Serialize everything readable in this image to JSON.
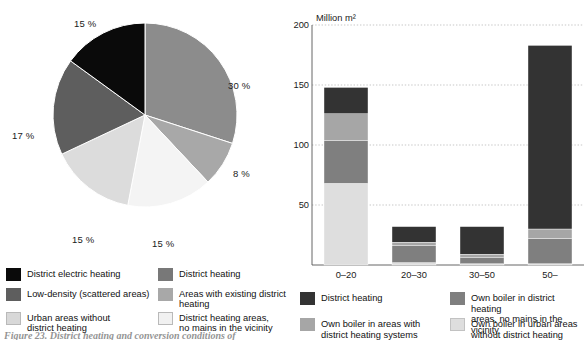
{
  "figure": {
    "caption": "Figure 23.  District heating and conversion conditions of"
  },
  "pie": {
    "labels": [
      "30 %",
      "8 %",
      "15 %",
      "15 %",
      "17 %",
      "15 %"
    ],
    "legend": [
      {
        "label": "District electric heating",
        "color": "#0a0a0a"
      },
      {
        "label": "District heating",
        "color": "#787878"
      },
      {
        "label": "Low-density (scattered areas)",
        "color": "#5e5e5e"
      },
      {
        "label": "Areas with existing district\nheating",
        "color": "#a8a8a8"
      },
      {
        "label": "Urban areas without\ndistrict heating",
        "color": "#d8d8d8"
      },
      {
        "label": "District heating areas,\nno mains in the vicinity",
        "color": "#f1f1f1"
      }
    ]
  },
  "bar": {
    "axis_unit": "Million m²",
    "y_ticks": [
      "200",
      "150",
      "100",
      "50"
    ],
    "x_ticks": [
      "0–20",
      "20–30",
      "30–50",
      "50–"
    ],
    "legend": [
      {
        "label": "District heating",
        "color": "#333333"
      },
      {
        "label": "Own boiler in district heating\nareas, no mains in the vicinity",
        "color": "#7f7f7f"
      },
      {
        "label": "Own boiler in areas with\ndistrict heating systems",
        "color": "#a6a6a6"
      },
      {
        "label": "Own boiler in urban areas\nwithout district heating",
        "color": "#dedede"
      }
    ]
  },
  "chart_data": [
    {
      "type": "pie",
      "title": "",
      "categories": [
        "District heating",
        "Areas with existing district heating",
        "District heating areas, no mains in the vicinity",
        "Urban areas without district heating",
        "Low-density (scattered areas)",
        "District electric heating"
      ],
      "values": [
        30,
        8,
        15,
        15,
        17,
        15
      ],
      "data_labels": [
        "30 %",
        "8 %",
        "15 %",
        "15 %",
        "17 %",
        "15 %"
      ],
      "colors": [
        "#8c8c8c",
        "#a8a8a8",
        "#f4f4f4",
        "#dcdcdc",
        "#5e5e5e",
        "#0a0a0a"
      ],
      "legend": "below",
      "units": "percent"
    },
    {
      "type": "bar",
      "stacked": true,
      "title": "",
      "xlabel": "",
      "ylabel": "Million m²",
      "ylim": [
        0,
        200
      ],
      "yticks": [
        0,
        50,
        100,
        150,
        200
      ],
      "grid": true,
      "categories": [
        "0–20",
        "20–30",
        "30–50",
        "50–"
      ],
      "series": [
        {
          "name": "Own boiler in urban areas without district heating",
          "color": "#dedede",
          "values": [
            68,
            2,
            1,
            1
          ]
        },
        {
          "name": "Own boiler in district heating areas, no mains in the vicinity",
          "color": "#7f7f7f",
          "values": [
            36,
            14,
            5,
            21
          ]
        },
        {
          "name": "Own boiler in areas with district heating systems",
          "color": "#a6a6a6",
          "values": [
            22,
            3,
            3,
            8
          ]
        },
        {
          "name": "District heating",
          "color": "#333333",
          "values": [
            22,
            13,
            23,
            153
          ]
        }
      ],
      "totals": [
        148,
        32,
        32,
        183
      ]
    }
  ]
}
